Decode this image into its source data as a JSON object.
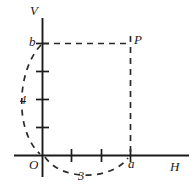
{
  "figure": {
    "type": "cartesian-coordinate-diagram",
    "background_color": "#ffffff",
    "ink_color": "#1b1b1b",
    "axes": {
      "horizontal": {
        "name": "horizontal-axis",
        "label": "H",
        "origin_label": "O",
        "tick_count": 3,
        "tick_values": [
          "1",
          "2",
          "3"
        ]
      },
      "vertical": {
        "name": "vertical-axis",
        "label": "V",
        "tick_count": 4,
        "tick_values": [
          "1",
          "2",
          "3",
          "4"
        ]
      }
    },
    "points": {
      "origin": {
        "label": "O",
        "x": 0,
        "y": 0
      },
      "p": {
        "label": "P",
        "x": 3,
        "y": 4
      },
      "a": {
        "label": "a",
        "axis": "horizontal",
        "value": 3
      },
      "b": {
        "label": "b",
        "axis": "vertical",
        "value": 4
      }
    },
    "dimensions": {
      "horizontal_span": {
        "label": "3",
        "from": "O",
        "to": "a"
      },
      "vertical_span": {
        "label": "4",
        "from": "O",
        "to": "b"
      }
    },
    "guides": {
      "horizontal_dashed": {
        "from": "b",
        "to": "P"
      },
      "vertical_dashed": {
        "from": "P",
        "to": "a"
      }
    }
  }
}
